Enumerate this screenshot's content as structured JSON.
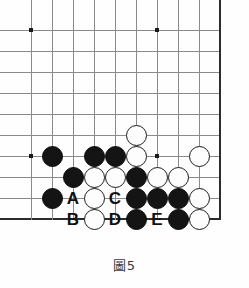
{
  "figure": {
    "type": "go-board-diagram",
    "caption": "圖5",
    "board": {
      "origin_x": 31,
      "origin_y": 30,
      "spacing": 21,
      "columns": 10,
      "rows": 10,
      "right_edge_col": 9,
      "bottom_edge_row": 9,
      "star_points": [
        {
          "col": 0,
          "row": 0
        },
        {
          "col": 6,
          "row": 0
        },
        {
          "col": 0,
          "row": 6
        },
        {
          "col": 6,
          "row": 6
        }
      ]
    },
    "stones": [
      {
        "color": "black",
        "col": 1,
        "row": 6
      },
      {
        "color": "black",
        "col": 3,
        "row": 6
      },
      {
        "color": "black",
        "col": 4,
        "row": 6
      },
      {
        "color": "white",
        "col": 5,
        "row": 5
      },
      {
        "color": "white",
        "col": 5,
        "row": 6
      },
      {
        "color": "white",
        "col": 8,
        "row": 6
      },
      {
        "color": "black",
        "col": 2,
        "row": 7
      },
      {
        "color": "white",
        "col": 3,
        "row": 7
      },
      {
        "color": "white",
        "col": 4,
        "row": 7
      },
      {
        "color": "black",
        "col": 5,
        "row": 7
      },
      {
        "color": "white",
        "col": 6,
        "row": 7
      },
      {
        "color": "white",
        "col": 7,
        "row": 7
      },
      {
        "color": "black",
        "col": 1,
        "row": 8
      },
      {
        "color": "white",
        "col": 3,
        "row": 8
      },
      {
        "color": "black",
        "col": 5,
        "row": 8
      },
      {
        "color": "black",
        "col": 6,
        "row": 8
      },
      {
        "color": "black",
        "col": 7,
        "row": 8
      },
      {
        "color": "white",
        "col": 8,
        "row": 8
      },
      {
        "color": "white",
        "col": 3,
        "row": 9
      },
      {
        "color": "black",
        "col": 5,
        "row": 9
      },
      {
        "color": "black",
        "col": 7,
        "row": 9
      },
      {
        "color": "white",
        "col": 8,
        "row": 9
      }
    ],
    "markers": [
      {
        "label": "A",
        "col": 2,
        "row": 8
      },
      {
        "label": "C",
        "col": 4,
        "row": 8
      },
      {
        "label": "B",
        "col": 2,
        "row": 9
      },
      {
        "label": "D",
        "col": 4,
        "row": 9
      },
      {
        "label": "E",
        "col": 6,
        "row": 9
      }
    ],
    "colors": {
      "grid": "#8a8a8a",
      "edge": "#2b2b2b",
      "black_stone": "#141414",
      "white_stone": "#fdfdfd",
      "white_stone_border": "#1c1c1c",
      "marker_text": "#111111",
      "caption_text": "#3a3a3a",
      "background": "#fefefe"
    }
  }
}
